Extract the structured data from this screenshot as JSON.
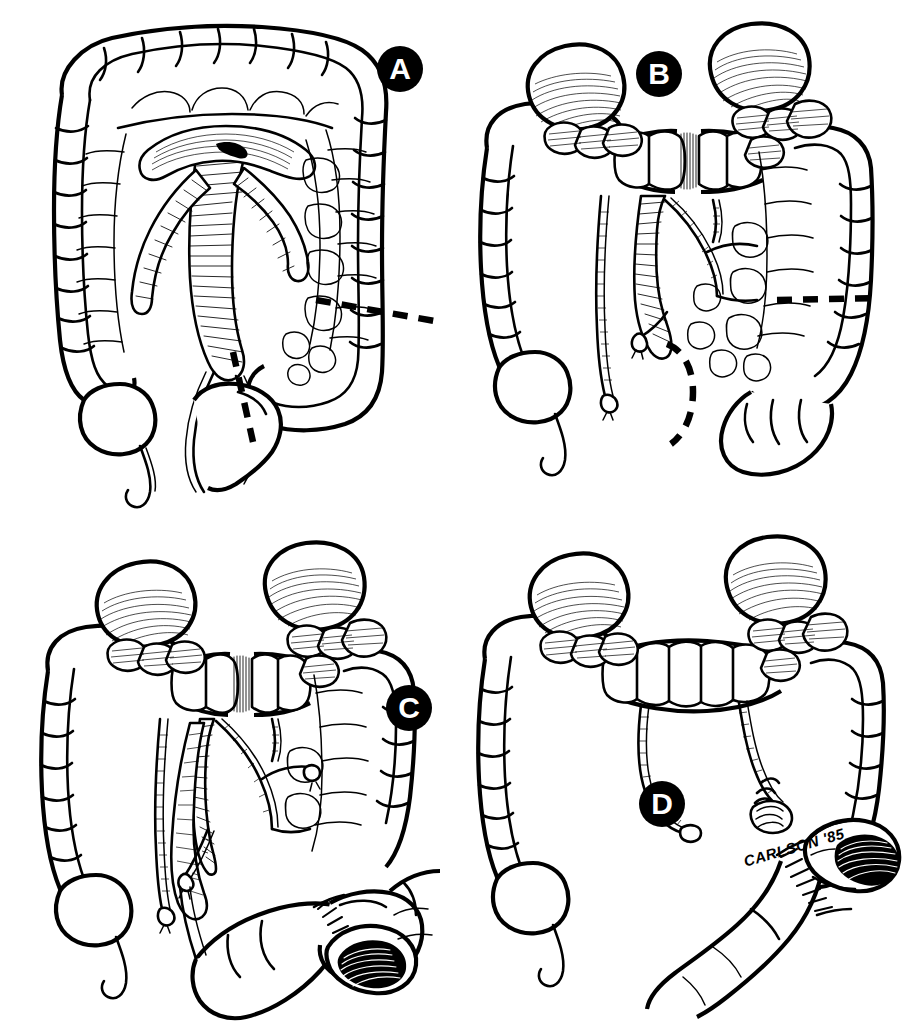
{
  "figure": {
    "medium": "pen-and-ink line drawing",
    "background_color": "#ffffff",
    "ink_color": "#000000",
    "signature": "CARLSON '85",
    "panel_count": 4
  },
  "panels": [
    {
      "id": "a",
      "label": "A",
      "label_style": "white letter in filled black circle",
      "description": "Opened colon with mesenteric vascular arcade exposed; dashed resection lines marked at descending colon and rectosigmoid",
      "features": [
        "haustrated colon frame",
        "cecum with appendix",
        "mesenteric vessel fan",
        "marginal artery arcade",
        "oblique dashed resection line",
        "vertical dashed resection line"
      ],
      "dashed_lines": 2
    },
    {
      "id": "b",
      "label": "B",
      "label_style": "white letter in filled black circle",
      "description": "Mobilized colon with hatched flexures and kidneys visible; transverse colon divided; dashed lines indicate remaining resection margins",
      "features": [
        "hepatic flexure mass",
        "splenic flexure mass",
        "divided transverse colon",
        "ligated vascular stumps",
        "horizontal dashed resection line",
        "curved dashed resection line"
      ],
      "dashed_lines": 2
    },
    {
      "id": "c",
      "label": "C",
      "label_style": "white letter in filled black circle",
      "description": "Specimen reflected with mesenteric pedicle divided; sutured anastomosis begun and open bowel lumen displayed",
      "features": [
        "divided mesentery",
        "ligated vessel stumps",
        "interrupted suture line",
        "open bowel lumen with hatched interior",
        "reflected rectosigmoid"
      ],
      "dashed_lines": 0
    },
    {
      "id": "d",
      "label": "D",
      "label_style": "white letter in filled black circle",
      "description": "Completed reconstruction showing colorectal anastomosis with suture line and remaining colon in continuity",
      "features": [
        "completed anastomosis",
        "interrupted suture line",
        "open distal lumen",
        "preserved ascending colon with appendix",
        "artist signature"
      ],
      "dashed_lines": 0
    }
  ],
  "labels": {
    "a": "A",
    "b": "B",
    "c": "C",
    "d": "D"
  },
  "colors": {
    "ink": "#000000",
    "paper": "#ffffff"
  }
}
